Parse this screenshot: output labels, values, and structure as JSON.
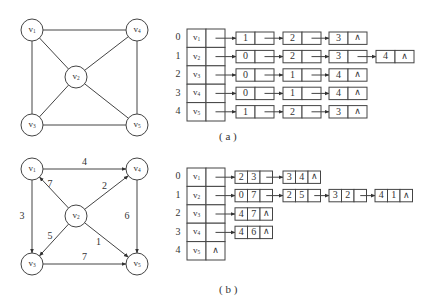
{
  "graph_a": {
    "caption": "( a )",
    "vertices": [
      {
        "id": "v1",
        "label": "v",
        "sub": "1",
        "x": 32,
        "y": 30
      },
      {
        "id": "v2",
        "label": "v",
        "sub": "2",
        "x": 76,
        "y": 77
      },
      {
        "id": "v3",
        "label": "v",
        "sub": "3",
        "x": 32,
        "y": 125
      },
      {
        "id": "v4",
        "label": "v",
        "sub": "4",
        "x": 137,
        "y": 30
      },
      {
        "id": "v5",
        "label": "v",
        "sub": "5",
        "x": 137,
        "y": 125
      }
    ],
    "edges": [
      [
        "v1",
        "v4"
      ],
      [
        "v1",
        "v3"
      ],
      [
        "v1",
        "v2"
      ],
      [
        "v2",
        "v4"
      ],
      [
        "v2",
        "v3"
      ],
      [
        "v2",
        "v5"
      ],
      [
        "v4",
        "v5"
      ],
      [
        "v3",
        "v5"
      ]
    ]
  },
  "graph_b": {
    "caption": "( b )",
    "vertices": [
      {
        "id": "v1",
        "label": "v",
        "sub": "1",
        "x": 32,
        "y": 169
      },
      {
        "id": "v2",
        "label": "v",
        "sub": "2",
        "x": 76,
        "y": 216
      },
      {
        "id": "v3",
        "label": "v",
        "sub": "3",
        "x": 32,
        "y": 264
      },
      {
        "id": "v4",
        "label": "v",
        "sub": "4",
        "x": 137,
        "y": 169
      },
      {
        "id": "v5",
        "label": "v",
        "sub": "5",
        "x": 137,
        "y": 264
      }
    ],
    "edges": [
      {
        "from": "v1",
        "to": "v4",
        "weight": "4"
      },
      {
        "from": "v1",
        "to": "v3",
        "weight": "3"
      },
      {
        "from": "v2",
        "to": "v1",
        "weight": "7"
      },
      {
        "from": "v2",
        "to": "v4",
        "weight": "2"
      },
      {
        "from": "v2",
        "to": "v3",
        "weight": "5"
      },
      {
        "from": "v2",
        "to": "v5",
        "weight": "1"
      },
      {
        "from": "v4",
        "to": "v5",
        "weight": "6"
      },
      {
        "from": "v3",
        "to": "v5",
        "weight": "7"
      }
    ]
  },
  "adjacency_list_a": {
    "rows": [
      {
        "index": "0",
        "vertex": "v",
        "sub": "1",
        "nodes": [
          [
            "1"
          ],
          [
            "2"
          ],
          [
            "3",
            "∧"
          ]
        ]
      },
      {
        "index": "1",
        "vertex": "v",
        "sub": "2",
        "nodes": [
          [
            "0"
          ],
          [
            "2"
          ],
          [
            "3"
          ],
          [
            "4",
            "∧"
          ]
        ]
      },
      {
        "index": "2",
        "vertex": "v",
        "sub": "3",
        "nodes": [
          [
            "0"
          ],
          [
            "1"
          ],
          [
            "4",
            "∧"
          ]
        ]
      },
      {
        "index": "3",
        "vertex": "v",
        "sub": "4",
        "nodes": [
          [
            "0"
          ],
          [
            "1"
          ],
          [
            "4",
            "∧"
          ]
        ]
      },
      {
        "index": "4",
        "vertex": "v",
        "sub": "5",
        "nodes": [
          [
            "1"
          ],
          [
            "2"
          ],
          [
            "3",
            "∧"
          ]
        ]
      }
    ]
  },
  "adjacency_list_b": {
    "rows": [
      {
        "index": "0",
        "vertex": "v",
        "sub": "1",
        "nodes": [
          [
            "2",
            "3"
          ],
          [
            "3",
            "4",
            "∧"
          ]
        ]
      },
      {
        "index": "1",
        "vertex": "v",
        "sub": "2",
        "nodes": [
          [
            "0",
            "7"
          ],
          [
            "2",
            "5"
          ],
          [
            "3",
            "2"
          ],
          [
            "4",
            "1",
            "∧"
          ]
        ]
      },
      {
        "index": "2",
        "vertex": "v",
        "sub": "3",
        "nodes": [
          [
            "4",
            "7",
            "∧"
          ]
        ]
      },
      {
        "index": "3",
        "vertex": "v",
        "sub": "4",
        "nodes": [
          [
            "4",
            "6",
            "∧"
          ]
        ]
      },
      {
        "index": "4",
        "vertex": "v",
        "sub": "5",
        "head_null": "∧",
        "nodes": []
      }
    ]
  },
  "colors": {
    "stroke": "#444444",
    "text": "#333333",
    "background": "#ffffff"
  }
}
